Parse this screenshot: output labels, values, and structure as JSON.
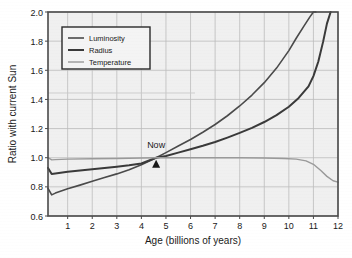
{
  "chart_data": {
    "type": "line",
    "title": "",
    "xlabel": "Age (billions of years)",
    "ylabel": "Ratio with current Sun",
    "xlim": [
      0.2,
      12
    ],
    "ylim": [
      0.6,
      2.0
    ],
    "xticks": [
      1,
      2,
      3,
      4,
      5,
      6,
      7,
      8,
      9,
      10,
      11,
      12
    ],
    "yticks": [
      "0.6",
      "0.8",
      "1.0",
      "1.2",
      "1.4",
      "1.6",
      "1.8",
      "2.0"
    ],
    "grid": true,
    "legend_position": "upper-left",
    "annotations": [
      {
        "text": "Now",
        "x": 4.6,
        "y": 1.0,
        "marker": "triangle-up"
      }
    ],
    "series": [
      {
        "name": "Luminosity",
        "color": "#4a4a4a",
        "width": 1.6,
        "x": [
          0.2,
          0.35,
          0.5,
          1.0,
          1.5,
          2.0,
          2.5,
          3.0,
          3.5,
          4.0,
          4.6,
          5.0,
          5.5,
          6.0,
          6.5,
          7.0,
          7.5,
          8.0,
          8.5,
          9.0,
          9.5,
          10.0,
          10.3,
          10.6,
          10.85,
          11.0,
          11.1
        ],
        "y": [
          0.79,
          0.745,
          0.757,
          0.787,
          0.812,
          0.838,
          0.864,
          0.889,
          0.917,
          0.952,
          1.0,
          1.035,
          1.08,
          1.125,
          1.175,
          1.228,
          1.288,
          1.355,
          1.43,
          1.515,
          1.615,
          1.735,
          1.82,
          1.9,
          1.965,
          2.0,
          2.0
        ]
      },
      {
        "name": "Radius",
        "color": "#3a3a3a",
        "width": 2.0,
        "x": [
          0.2,
          0.35,
          0.5,
          1.0,
          1.5,
          2.0,
          2.5,
          3.0,
          3.5,
          4.0,
          4.6,
          5.0,
          5.5,
          6.0,
          6.5,
          7.0,
          7.5,
          8.0,
          8.5,
          9.0,
          9.5,
          10.0,
          10.4,
          10.8,
          11.0,
          11.2,
          11.4,
          11.55,
          11.7
        ],
        "y": [
          0.93,
          0.888,
          0.892,
          0.903,
          0.912,
          0.921,
          0.929,
          0.938,
          0.948,
          0.96,
          1.0,
          1.012,
          1.035,
          1.058,
          1.082,
          1.108,
          1.138,
          1.17,
          1.205,
          1.245,
          1.292,
          1.35,
          1.41,
          1.49,
          1.56,
          1.66,
          1.8,
          1.92,
          2.0
        ]
      },
      {
        "name": "Temperature",
        "color": "#9a9a9a",
        "width": 1.4,
        "x": [
          0.2,
          0.35,
          0.5,
          1.0,
          2.0,
          3.0,
          4.0,
          4.6,
          5.0,
          6.0,
          7.0,
          8.0,
          9.0,
          9.8,
          10.3,
          10.7,
          11.0,
          11.3,
          11.55,
          11.8,
          12.0
        ],
        "y": [
          1.0,
          0.985,
          0.987,
          0.99,
          0.993,
          0.995,
          0.998,
          1.0,
          1.0,
          1.0,
          1.0,
          1.0,
          0.998,
          0.995,
          0.99,
          0.978,
          0.955,
          0.912,
          0.872,
          0.842,
          0.832
        ]
      }
    ]
  },
  "legend": {
    "items": [
      {
        "label": "Luminosity"
      },
      {
        "label": "Radius"
      },
      {
        "label": "Temperature"
      }
    ]
  },
  "style": {
    "plot_background": "#f0f0f0",
    "grid_color": "#bdbdbd",
    "axis_color": "#4a4a4a",
    "text_color": "#1a1a1a",
    "page_background": "#ffffff"
  }
}
